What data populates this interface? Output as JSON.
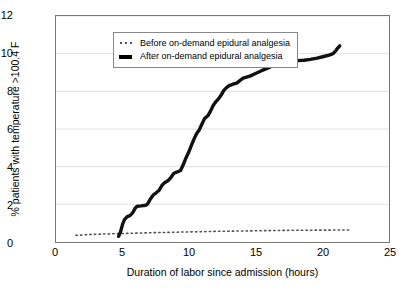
{
  "chart_data": {
    "type": "line",
    "title": "",
    "subtitle": "",
    "xlabel": "Duration of labor since admission (hours)",
    "ylabel": "% patients with temperature >100.4 F",
    "xlim": [
      0,
      25
    ],
    "ylim": [
      0,
      12
    ],
    "xticks": [
      0,
      5,
      10,
      15,
      20,
      25
    ],
    "yticks": [
      0,
      2,
      4,
      6,
      8,
      10,
      12
    ],
    "grid": "horizontal",
    "legend_position": "top-left-inside",
    "series": [
      {
        "name": "Before on-demand epidural analgesia",
        "style": "dotted",
        "color": "#555555",
        "marker": "dotted-line",
        "points": [
          [
            1.5,
            0.35
          ],
          [
            2.5,
            0.4
          ],
          [
            3.5,
            0.42
          ],
          [
            4.5,
            0.44
          ],
          [
            5.5,
            0.46
          ],
          [
            6.5,
            0.48
          ],
          [
            7.5,
            0.5
          ],
          [
            8.5,
            0.51
          ],
          [
            9.5,
            0.53
          ],
          [
            10.5,
            0.54
          ],
          [
            11.5,
            0.56
          ],
          [
            12.5,
            0.57
          ],
          [
            13.5,
            0.58
          ],
          [
            14.5,
            0.59
          ],
          [
            15.5,
            0.6
          ],
          [
            16.5,
            0.61
          ],
          [
            17.5,
            0.62
          ],
          [
            18.5,
            0.62
          ],
          [
            19.5,
            0.63
          ],
          [
            20.5,
            0.63
          ],
          [
            21.5,
            0.64
          ],
          [
            22.0,
            0.64
          ]
        ]
      },
      {
        "name": "After on-demand epidural analgesia",
        "style": "solid",
        "color": "#111111",
        "marker": "thick-line",
        "points": [
          [
            4.7,
            0.3
          ],
          [
            4.85,
            0.55
          ],
          [
            5.0,
            0.95
          ],
          [
            5.15,
            1.2
          ],
          [
            5.35,
            1.35
          ],
          [
            5.55,
            1.4
          ],
          [
            5.75,
            1.55
          ],
          [
            5.95,
            1.8
          ],
          [
            6.1,
            1.9
          ],
          [
            6.4,
            1.92
          ],
          [
            6.75,
            1.95
          ],
          [
            6.9,
            2.05
          ],
          [
            7.1,
            2.3
          ],
          [
            7.3,
            2.5
          ],
          [
            7.5,
            2.6
          ],
          [
            7.75,
            2.75
          ],
          [
            7.95,
            3.0
          ],
          [
            8.15,
            3.15
          ],
          [
            8.4,
            3.25
          ],
          [
            8.65,
            3.45
          ],
          [
            8.85,
            3.65
          ],
          [
            9.1,
            3.72
          ],
          [
            9.35,
            3.8
          ],
          [
            9.55,
            4.1
          ],
          [
            9.75,
            4.45
          ],
          [
            9.95,
            4.75
          ],
          [
            10.15,
            5.1
          ],
          [
            10.35,
            5.45
          ],
          [
            10.55,
            5.75
          ],
          [
            10.75,
            5.95
          ],
          [
            10.95,
            6.25
          ],
          [
            11.15,
            6.55
          ],
          [
            11.4,
            6.7
          ],
          [
            11.6,
            6.95
          ],
          [
            11.8,
            7.25
          ],
          [
            12.0,
            7.45
          ],
          [
            12.2,
            7.6
          ],
          [
            12.4,
            7.8
          ],
          [
            12.6,
            8.05
          ],
          [
            12.8,
            8.2
          ],
          [
            13.0,
            8.3
          ],
          [
            13.3,
            8.38
          ],
          [
            13.6,
            8.45
          ],
          [
            13.85,
            8.6
          ],
          [
            14.05,
            8.7
          ],
          [
            14.3,
            8.75
          ],
          [
            14.6,
            8.82
          ],
          [
            14.9,
            8.92
          ],
          [
            15.3,
            9.05
          ],
          [
            15.7,
            9.18
          ],
          [
            16.1,
            9.3
          ],
          [
            16.5,
            9.45
          ],
          [
            16.85,
            9.58
          ],
          [
            17.1,
            9.62
          ],
          [
            17.6,
            9.63
          ],
          [
            18.1,
            9.63
          ],
          [
            18.6,
            9.65
          ],
          [
            19.1,
            9.7
          ],
          [
            19.6,
            9.76
          ],
          [
            20.1,
            9.85
          ],
          [
            20.5,
            9.92
          ],
          [
            20.8,
            10.0
          ],
          [
            21.0,
            10.15
          ],
          [
            21.15,
            10.3
          ],
          [
            21.3,
            10.42
          ]
        ]
      }
    ]
  },
  "legend": {
    "entries": [
      {
        "label": "Before on-demand epidural analgesia",
        "swatch": "dotted-line-swatch"
      },
      {
        "label": "After on-demand epidural analgesia",
        "swatch": "solid-line-swatch"
      }
    ]
  },
  "axes": {
    "y_tick_labels": [
      "12",
      "10",
      "8",
      "6",
      "4",
      "2",
      "0"
    ],
    "x_tick_labels": [
      "0",
      "5",
      "10",
      "15",
      "20",
      "25"
    ],
    "y_title": "% patients with temperature >100.4 F",
    "x_title": "Duration of labor since admission (hours)"
  },
  "colors": {
    "after_series": "#111111",
    "before_series": "#555555",
    "grid": "#e2e2e2",
    "frame": "#777777",
    "background": "#ffffff"
  }
}
